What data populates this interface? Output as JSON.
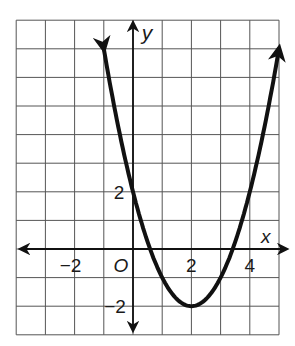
{
  "chart_data": {
    "type": "line",
    "title": "",
    "xlabel": "x",
    "ylabel": "y",
    "origin_label": "O",
    "function": "y = (x - 2)^2 - 2",
    "xlim": [
      -4,
      5
    ],
    "ylim": [
      -3,
      8
    ],
    "grid": true,
    "grid_step": 1,
    "x_tick_labels": [
      {
        "value": -2,
        "label": "−2"
      },
      {
        "value": 2,
        "label": "2"
      },
      {
        "value": 4,
        "label": "4"
      }
    ],
    "y_tick_labels": [
      {
        "value": 2,
        "label": "2"
      },
      {
        "value": -2,
        "label": "−2"
      }
    ],
    "key_points": [
      {
        "x": 0,
        "y": 2,
        "note": "y-intercept"
      },
      {
        "x": 2,
        "y": -2,
        "note": "vertex (minimum)"
      },
      {
        "x": 0.59,
        "y": 0,
        "note": "x-intercept"
      },
      {
        "x": 3.41,
        "y": 0,
        "note": "x-intercept"
      }
    ],
    "series": [
      {
        "name": "parabola",
        "x": [
          -1,
          -0.5,
          0,
          0.5,
          1,
          1.5,
          2,
          2.5,
          3,
          3.5,
          4,
          4.5,
          5
        ],
        "values": [
          7,
          4.25,
          2,
          0.25,
          -1,
          -1.75,
          -2,
          -1.75,
          -1,
          0.25,
          2,
          4.25,
          7
        ]
      }
    ],
    "arrows": {
      "curve_ends": true,
      "axes": [
        "x+",
        "x-",
        "y+",
        "y-"
      ]
    },
    "colors": {
      "curve": "#111111",
      "grid": "#555555",
      "axes": "#111111",
      "background": "#ffffff"
    }
  }
}
